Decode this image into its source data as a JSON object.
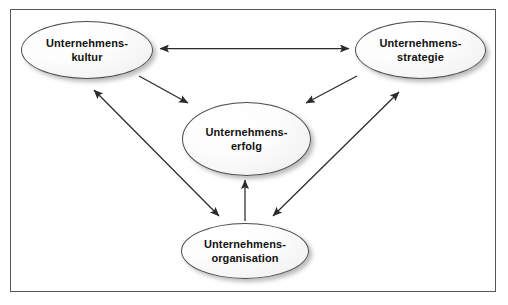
{
  "diagram": {
    "language": "de",
    "frame": {
      "border_color": "#58585a",
      "background_color": "#ffffff"
    },
    "style": {
      "node_fill": "#f7f7f7",
      "node_border": "#4c4c4e",
      "node_shadow": "#78787a",
      "text_color": "#111111",
      "arrow_color": "#2b2b2d"
    },
    "nodes": [
      {
        "id": "kultur",
        "label": "Unternehmens-\nkultur",
        "line1": "Unternehmens-",
        "line2": "kultur",
        "position": "top-left"
      },
      {
        "id": "strategie",
        "label": "Unternehmens-\nstrategie",
        "line1": "Unternehmens-",
        "line2": "strategie",
        "position": "top-right"
      },
      {
        "id": "erfolg",
        "label": "Unternehmens-\nerfolg",
        "line1": "Unternehmens-",
        "line2": "erfolg",
        "position": "center"
      },
      {
        "id": "organisation",
        "label": "Unternehmens-\norganisation",
        "line1": "Unternehmens-",
        "line2": "organisation",
        "position": "bottom-center"
      }
    ],
    "edges": [
      {
        "id": "kultur-strategie",
        "from": "kultur",
        "to": "strategie",
        "heads": "both",
        "orientation": "horizontal"
      },
      {
        "id": "kultur-erfolg",
        "from": "kultur",
        "to": "erfolg",
        "heads": "single",
        "orientation": "diagonal-down-right"
      },
      {
        "id": "strategie-erfolg",
        "from": "strategie",
        "to": "erfolg",
        "heads": "single",
        "orientation": "diagonal-down-left"
      },
      {
        "id": "kultur-organisation",
        "from": "kultur",
        "to": "organisation",
        "heads": "both",
        "orientation": "diagonal"
      },
      {
        "id": "strategie-organisation",
        "from": "organisation",
        "to": "strategie",
        "heads": "both",
        "orientation": "diagonal"
      },
      {
        "id": "organisation-erfolg",
        "from": "organisation",
        "to": "erfolg",
        "heads": "single",
        "orientation": "vertical"
      }
    ]
  }
}
